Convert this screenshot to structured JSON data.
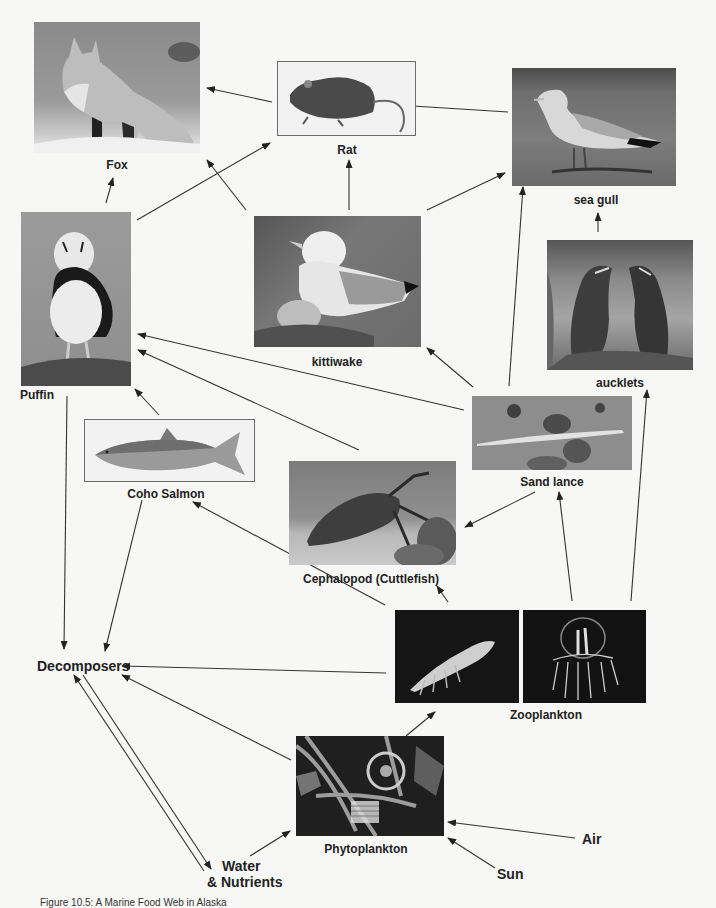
{
  "diagram": {
    "title": "Marine Food Web",
    "caption": "Figure 10.5: A Marine Food Web in Alaska",
    "nodes": {
      "fox": {
        "label": "Fox",
        "image": "photo of a red fox standing on snow"
      },
      "rat": {
        "label": "Rat",
        "image": "photo of a brown rat"
      },
      "sea_gull": {
        "label": "sea gull",
        "image": "photo of a sea gull standing on gravel"
      },
      "puffin": {
        "label": "Puffin",
        "image": "photo of a horned puffin on a rock"
      },
      "kittiwake": {
        "label": "kittiwake",
        "image": "photo of a kittiwake with chick on nest"
      },
      "auklets": {
        "label": "aucklets",
        "image": "photo of two auklets"
      },
      "coho_salmon": {
        "label": "Coho Salmon",
        "image": "illustration of a coho salmon"
      },
      "sand_lance": {
        "label": "Sand lance",
        "image": "photo of a sand lance fish on sand"
      },
      "cephalopod": {
        "label": "Cephalopod (Cuttlefish)",
        "image": "photo of a cuttlefish near coral"
      },
      "zooplankton": {
        "label": "Zooplankton",
        "images": [
          "photo of krill on dark background",
          "photo of a jellyfish on dark background"
        ]
      },
      "phytoplankton": {
        "label": "Phytoplankton",
        "image": "microscope photo of diatoms"
      },
      "decomposers": {
        "label": "Decomposers"
      },
      "water_nutrients": {
        "label_line1": "Water",
        "label_line2": "& Nutrients"
      },
      "air": {
        "label": "Air"
      },
      "sun": {
        "label": "Sun"
      }
    },
    "edges": [
      {
        "from": "Rat",
        "to": "Fox"
      },
      {
        "from": "Sea gull",
        "to": "Rat"
      },
      {
        "from": "Puffin",
        "to": "Fox"
      },
      {
        "from": "Puffin",
        "to": "Rat"
      },
      {
        "from": "Kittiwake",
        "to": "Fox"
      },
      {
        "from": "Kittiwake",
        "to": "Rat"
      },
      {
        "from": "Kittiwake",
        "to": "Sea gull"
      },
      {
        "from": "Auklets",
        "to": "Sea gull"
      },
      {
        "from": "Sand lance",
        "to": "Sea gull"
      },
      {
        "from": "Sand lance",
        "to": "Kittiwake"
      },
      {
        "from": "Sand lance",
        "to": "Puffin"
      },
      {
        "from": "Sand lance",
        "to": "Cephalopod"
      },
      {
        "from": "Cephalopod",
        "to": "Puffin"
      },
      {
        "from": "Coho Salmon",
        "to": "Puffin"
      },
      {
        "from": "Zooplankton",
        "to": "Sand lance"
      },
      {
        "from": "Zooplankton",
        "to": "Auklets"
      },
      {
        "from": "Zooplankton",
        "to": "Cephalopod"
      },
      {
        "from": "Zooplankton",
        "to": "Coho Salmon"
      },
      {
        "from": "Zooplankton",
        "to": "Decomposers"
      },
      {
        "from": "Phytoplankton",
        "to": "Zooplankton"
      },
      {
        "from": "Phytoplankton",
        "to": "Decomposers"
      },
      {
        "from": "Puffin",
        "to": "Decomposers"
      },
      {
        "from": "Coho Salmon",
        "to": "Decomposers"
      },
      {
        "from": "Decomposers",
        "to": "Water & Nutrients"
      },
      {
        "from": "Water & Nutrients",
        "to": "Decomposers"
      },
      {
        "from": "Water & Nutrients",
        "to": "Phytoplankton"
      },
      {
        "from": "Air",
        "to": "Phytoplankton"
      },
      {
        "from": "Sun",
        "to": "Phytoplankton"
      }
    ]
  }
}
